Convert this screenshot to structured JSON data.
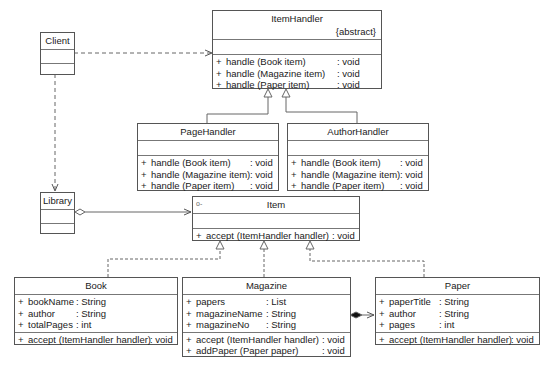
{
  "diagram": {
    "type": "UML class diagram",
    "classes": {
      "client": {
        "name": "Client"
      },
      "item_handler": {
        "name": "ItemHandler",
        "stereotype": "{abstract}",
        "methods": [
          {
            "vis": "+",
            "name": "handle (Book item)",
            "type": ": void"
          },
          {
            "vis": "+",
            "name": "handle (Magazine item)",
            "type": ": void"
          },
          {
            "vis": "+",
            "name": "handle (Paper item)",
            "type": ": void"
          }
        ]
      },
      "page_handler": {
        "name": "PageHandler",
        "methods": [
          {
            "vis": "+",
            "name": "handle (Book item)",
            "type": ": void"
          },
          {
            "vis": "+",
            "name": "handle (Magazine item)",
            "type": ": void"
          },
          {
            "vis": "+",
            "name": "handle (Paper item)",
            "type": ": void"
          }
        ]
      },
      "author_handler": {
        "name": "AuthorHandler",
        "methods": [
          {
            "vis": "+",
            "name": "handle (Book item)",
            "type": ": void"
          },
          {
            "vis": "+",
            "name": "handle (Magazine item)",
            "type": ": void"
          },
          {
            "vis": "+",
            "name": "handle (Paper item)",
            "type": ": void"
          }
        ]
      },
      "library": {
        "name": "Library"
      },
      "item": {
        "name": "Item",
        "interface_icon": "o-",
        "methods": [
          {
            "vis": "+",
            "name": "accept (ItemHandler handler)",
            "type": ": void"
          }
        ]
      },
      "book": {
        "name": "Book",
        "attributes": [
          {
            "vis": "+",
            "name": "bookName",
            "type": ": String"
          },
          {
            "vis": "+",
            "name": "author",
            "type": ": String"
          },
          {
            "vis": "+",
            "name": "totalPages",
            "type": ": int"
          }
        ],
        "methods": [
          {
            "vis": "+",
            "name": "accept (ItemHandler handler)",
            "type": ": void"
          }
        ]
      },
      "magazine": {
        "name": "Magazine",
        "attributes": [
          {
            "vis": "+",
            "name": "papers",
            "type": ": List"
          },
          {
            "vis": "+",
            "name": "magazineName",
            "type": ": String"
          },
          {
            "vis": "+",
            "name": "magazineNo",
            "type": ": String"
          }
        ],
        "methods": [
          {
            "vis": "+",
            "name": "accept (ItemHandler handler)",
            "type": ": void"
          },
          {
            "vis": "+",
            "name": "addPaper (Paper paper)",
            "type": ": void"
          }
        ]
      },
      "paper": {
        "name": "Paper",
        "attributes": [
          {
            "vis": "+",
            "name": "paperTitle",
            "type": ": String"
          },
          {
            "vis": "+",
            "name": "author",
            "type": ": String"
          },
          {
            "vis": "+",
            "name": "pages",
            "type": ": int"
          }
        ],
        "methods": [
          {
            "vis": "+",
            "name": "accept (ItemHandler handler)",
            "type": ": void"
          }
        ]
      }
    },
    "relationships": [
      {
        "from": "Client",
        "to": "ItemHandler",
        "kind": "dependency"
      },
      {
        "from": "Client",
        "to": "Library",
        "kind": "dependency"
      },
      {
        "from": "PageHandler",
        "to": "ItemHandler",
        "kind": "generalization"
      },
      {
        "from": "AuthorHandler",
        "to": "ItemHandler",
        "kind": "generalization"
      },
      {
        "from": "Library",
        "to": "Item",
        "kind": "aggregation"
      },
      {
        "from": "Book",
        "to": "Item",
        "kind": "realization"
      },
      {
        "from": "Magazine",
        "to": "Item",
        "kind": "realization"
      },
      {
        "from": "Paper",
        "to": "Item",
        "kind": "realization"
      },
      {
        "from": "Magazine",
        "to": "Paper",
        "kind": "composition"
      }
    ]
  }
}
